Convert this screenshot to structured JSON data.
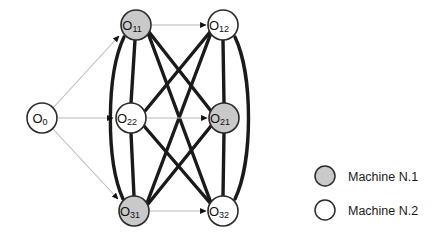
{
  "figure": {
    "background_color": "#ffffff",
    "colors": {
      "machine1_fill": "#c9c9c9",
      "machine2_fill": "#ffffff",
      "node_stroke": "#2b2b2b",
      "disjunctive_edge": "#1a1a1a",
      "conjunctive_edge": "#b9b9b9",
      "arrow_fill": "#111111",
      "legend_text": "#1a1a1a"
    },
    "nodes": [
      {
        "id": "O0",
        "label": "O",
        "sub": "0",
        "cx": 42,
        "cy": 118,
        "r": 15,
        "machine": "none",
        "fill": "#ffffff"
      },
      {
        "id": "O11",
        "label": "O",
        "sub": "11",
        "cx": 136,
        "cy": 25,
        "r": 15,
        "machine": "1",
        "fill": "#c9c9c9"
      },
      {
        "id": "O12",
        "label": "O",
        "sub": "12",
        "cx": 223,
        "cy": 25,
        "r": 15,
        "machine": "2",
        "fill": "#ffffff"
      },
      {
        "id": "O22",
        "label": "O",
        "sub": "22",
        "cx": 131,
        "cy": 118,
        "r": 15,
        "machine": "2",
        "fill": "#ffffff"
      },
      {
        "id": "O21",
        "label": "O",
        "sub": "21",
        "cx": 224,
        "cy": 118,
        "r": 15,
        "machine": "1",
        "fill": "#c9c9c9"
      },
      {
        "id": "O31",
        "label": "O",
        "sub": "31",
        "cx": 134,
        "cy": 211,
        "r": 15,
        "machine": "1",
        "fill": "#c9c9c9"
      },
      {
        "id": "O32",
        "label": "O",
        "sub": "32",
        "cx": 223,
        "cy": 211,
        "r": 15,
        "machine": "2",
        "fill": "#ffffff"
      }
    ],
    "conjunctive_edges": [
      {
        "from": "O0",
        "to": "O11",
        "arrow": true
      },
      {
        "from": "O0",
        "to": "O22",
        "arrow": true
      },
      {
        "from": "O0",
        "to": "O31",
        "arrow": true
      },
      {
        "from": "O11",
        "to": "O12",
        "arrow": true
      },
      {
        "from": "O22",
        "to": "O21",
        "arrow": true
      },
      {
        "from": "O31",
        "to": "O32",
        "arrow": true
      }
    ],
    "disjunctive_edges": [
      {
        "from": "O11",
        "to": "O22",
        "style": "straight"
      },
      {
        "from": "O22",
        "to": "O31",
        "style": "straight"
      },
      {
        "from": "O11",
        "to": "O31",
        "style": "curve-left"
      },
      {
        "from": "O12",
        "to": "O21",
        "style": "straight"
      },
      {
        "from": "O21",
        "to": "O32",
        "style": "straight"
      },
      {
        "from": "O12",
        "to": "O32",
        "style": "curve-right"
      },
      {
        "from": "O11",
        "to": "O21",
        "style": "straight"
      },
      {
        "from": "O11",
        "to": "O32",
        "style": "straight"
      },
      {
        "from": "O12",
        "to": "O22",
        "style": "straight"
      },
      {
        "from": "O12",
        "to": "O31",
        "style": "straight"
      },
      {
        "from": "O22",
        "to": "O32",
        "style": "straight"
      },
      {
        "from": "O21",
        "to": "O31",
        "style": "straight"
      }
    ]
  },
  "legend": {
    "items": [
      {
        "swatch": "machine1-swatch",
        "fill": "#c9c9c9",
        "label": "Machine N.1",
        "cx": 325,
        "cy": 176,
        "r": 10,
        "text_x": 348,
        "text_y": 176
      },
      {
        "swatch": "machine2-swatch",
        "fill": "#ffffff",
        "label": "Machine N.2",
        "cx": 325,
        "cy": 210,
        "r": 10,
        "text_x": 348,
        "text_y": 210
      }
    ]
  }
}
